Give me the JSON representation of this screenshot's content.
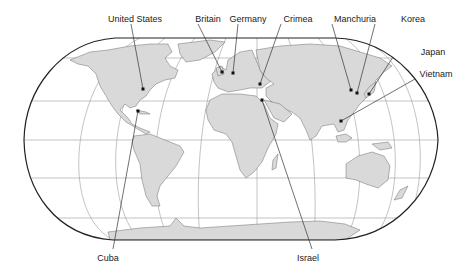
{
  "map": {
    "projection": "robinson-like world map",
    "colors": {
      "background": "#ffffff",
      "land": "#d9d9d9",
      "land_stroke": "#6e6e6e",
      "frame": "#222222",
      "graticule": "#9a9a9a",
      "leader": "#333333",
      "marker": "#111111",
      "label": "#1a1a1a"
    },
    "labels": [
      {
        "id": "united-states",
        "text": "United States",
        "x": 135,
        "y": 14,
        "dot": [
          143,
          89
        ],
        "anchor": [
          131,
          24
        ]
      },
      {
        "id": "britain",
        "text": "Britain",
        "x": 208,
        "y": 14,
        "dot": [
          222,
          72
        ],
        "anchor": [
          198,
          24
        ]
      },
      {
        "id": "germany",
        "text": "Germany",
        "x": 248,
        "y": 14,
        "dot": [
          233,
          73
        ],
        "anchor": [
          238,
          24
        ]
      },
      {
        "id": "crimea",
        "text": "Crimea",
        "x": 298,
        "y": 14,
        "dot": [
          260,
          84
        ],
        "anchor": [
          281,
          24
        ]
      },
      {
        "id": "manchuria",
        "text": "Manchuria",
        "x": 355,
        "y": 14,
        "dot": [
          351,
          90
        ],
        "anchor": [
          332,
          24
        ]
      },
      {
        "id": "korea",
        "text": "Korea",
        "x": 413,
        "y": 14,
        "dot": [
          357,
          93
        ],
        "anchor": [
          375,
          24
        ]
      },
      {
        "id": "japan",
        "text": "Japan",
        "x": 433,
        "y": 47,
        "dot": [
          369,
          94
        ],
        "anchor": [
          393,
          57
        ]
      },
      {
        "id": "vietnam",
        "text": "Vietnam",
        "x": 436,
        "y": 69,
        "dot": [
          341,
          121
        ],
        "anchor": [
          415,
          79
        ]
      },
      {
        "id": "cuba",
        "text": "Cuba",
        "x": 108,
        "y": 253,
        "dot": [
          138,
          111
        ],
        "anchor": [
          113,
          249
        ]
      },
      {
        "id": "israel",
        "text": "Israel",
        "x": 308,
        "y": 253,
        "dot": [
          262,
          100
        ],
        "anchor": [
          312,
          249
        ]
      }
    ]
  }
}
